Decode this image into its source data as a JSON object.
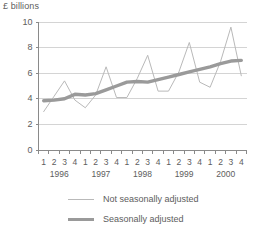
{
  "chart_data": {
    "type": "line",
    "title": "",
    "ylabel": "£ billions",
    "xlabel": "",
    "ylim": [
      0,
      10
    ],
    "yticks": [
      0,
      2,
      4,
      6,
      8,
      10
    ],
    "grid": true,
    "legend_position": "bottom",
    "x": [
      "1996 Q1",
      "1996 Q2",
      "1996 Q3",
      "1996 Q4",
      "1997 Q1",
      "1997 Q2",
      "1997 Q3",
      "1997 Q4",
      "1998 Q1",
      "1998 Q2",
      "1998 Q3",
      "1998 Q4",
      "1999 Q1",
      "1999 Q2",
      "1999 Q3",
      "1999 Q4",
      "2000 Q1",
      "2000 Q2",
      "2000 Q3",
      "2000 Q4"
    ],
    "quarter_labels": [
      "1",
      "2",
      "3",
      "4",
      "1",
      "2",
      "3",
      "4",
      "1",
      "2",
      "3",
      "4",
      "1",
      "2",
      "3",
      "4",
      "1",
      "2",
      "3",
      "4"
    ],
    "year_labels": [
      "1996",
      "1997",
      "1998",
      "1999",
      "2000"
    ],
    "series": [
      {
        "name": "Not seasonally adjusted",
        "style": "thin",
        "color": "#b9b9b9",
        "values": [
          3.0,
          4.2,
          5.4,
          3.9,
          3.3,
          4.3,
          6.5,
          4.1,
          4.1,
          5.6,
          7.4,
          4.6,
          4.6,
          6.1,
          8.4,
          5.3,
          4.9,
          6.9,
          9.6,
          5.8
        ]
      },
      {
        "name": "Seasonally adjusted",
        "style": "thick",
        "color": "#9a9a9a",
        "values": [
          3.85,
          3.9,
          4.0,
          4.35,
          4.3,
          4.4,
          4.7,
          5.0,
          5.3,
          5.35,
          5.3,
          5.5,
          5.7,
          5.9,
          6.1,
          6.3,
          6.5,
          6.75,
          6.95,
          7.0
        ]
      }
    ]
  },
  "legend": {
    "items": [
      {
        "label": "Not seasonally adjusted"
      },
      {
        "label": "Seasonally adjusted"
      }
    ]
  },
  "colors": {
    "grid": "#d4d4d4",
    "axis": "#8a8a8a",
    "text": "#5d5d5d",
    "series_thin": "#b9b9b9",
    "series_thick": "#9a9a9a",
    "background": "#ffffff"
  }
}
